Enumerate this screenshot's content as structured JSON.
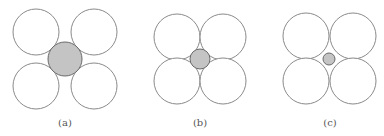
{
  "figure": {
    "colors": {
      "outline": "#8a8a8a",
      "shaded_fill": "#c4c4c4",
      "shaded_outline": "#6a6a6a",
      "label": "#555555"
    },
    "panels": [
      {
        "label": "(a)",
        "label_pos": [
          65,
          126
        ],
        "large_radius": 23,
        "large_centers": [
          [
            36,
            32
          ],
          [
            94,
            32
          ],
          [
            36,
            86
          ],
          [
            94,
            86
          ]
        ],
        "small_center": [
          65,
          59
        ],
        "small_radius": 17
      },
      {
        "label": "(b)",
        "label_pos": [
          200,
          126
        ],
        "large_radius": 23,
        "large_centers": [
          [
            177,
            37
          ],
          [
            223,
            37
          ],
          [
            177,
            81
          ],
          [
            223,
            81
          ]
        ],
        "small_center": [
          200,
          59
        ],
        "small_radius": 10
      },
      {
        "label": "(c)",
        "label_pos": [
          330,
          126
        ],
        "large_radius": 23,
        "large_centers": [
          [
            306,
            36
          ],
          [
            353,
            36
          ],
          [
            306,
            81
          ],
          [
            353,
            81
          ]
        ],
        "small_center": [
          329,
          59
        ],
        "small_radius": 6
      }
    ]
  }
}
